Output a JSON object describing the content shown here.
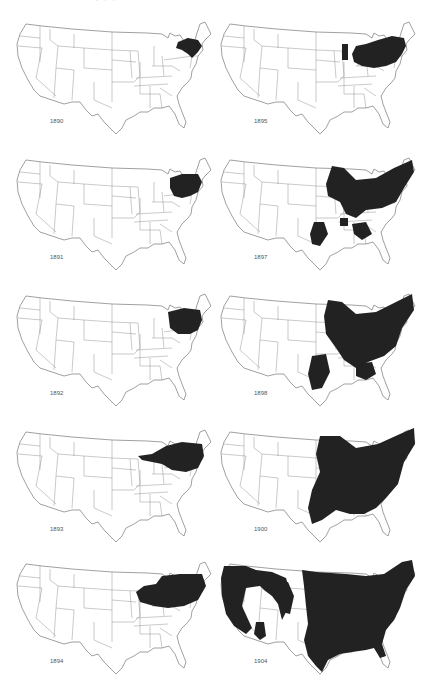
{
  "figure": {
    "top_caption_fragment": "·  ·  ·",
    "layout": {
      "columns": 2,
      "rows": 5,
      "order": "left column 1890–1894, right column 1895–1904"
    },
    "fill_color": "#222222",
    "outline_color": "#888888",
    "background_color": "#ffffff"
  },
  "maps": [
    {
      "year": "1890",
      "col": 0,
      "row": 0,
      "extent": "new-england"
    },
    {
      "year": "1895",
      "col": 1,
      "row": 0,
      "extent": "northeast-ohio-valley"
    },
    {
      "year": "1891",
      "col": 0,
      "row": 1,
      "extent": "new-england-pa"
    },
    {
      "year": "1897",
      "col": 1,
      "row": 1,
      "extent": "east-midwest-texas-spots"
    },
    {
      "year": "1892",
      "col": 0,
      "row": 2,
      "extent": "new-england-pa-ny"
    },
    {
      "year": "1898",
      "col": 1,
      "row": 2,
      "extent": "east-midwest-texas"
    },
    {
      "year": "1893",
      "col": 0,
      "row": 3,
      "extent": "northeast-illinois-band"
    },
    {
      "year": "1900",
      "col": 1,
      "row": 3,
      "extent": "east-half-wide"
    },
    {
      "year": "1894",
      "col": 0,
      "row": 4,
      "extent": "northeast-midwest"
    },
    {
      "year": "1904",
      "col": 1,
      "row": 4,
      "extent": "nearly-nationwide"
    }
  ]
}
